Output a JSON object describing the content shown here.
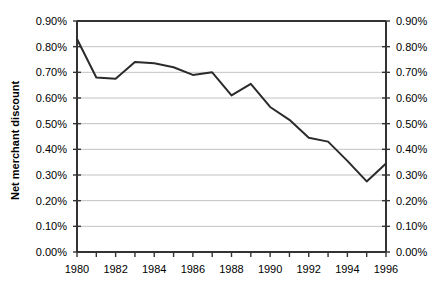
{
  "chart_data": {
    "type": "line",
    "title": "",
    "xlabel": "",
    "ylabel": "Net merchant discount",
    "ylabel_right": "",
    "grid": true,
    "legend": "none",
    "xlim": [
      1980,
      1996
    ],
    "ylim": [
      0.0,
      0.9
    ],
    "y_tick_labels": [
      "0.90%",
      "0.80%",
      "0.70%",
      "0.60%",
      "0.50%",
      "0.40%",
      "0.30%",
      "0.20%",
      "0.10%",
      "0.00%"
    ],
    "y_tick_values": [
      0.9,
      0.8,
      0.7,
      0.6,
      0.5,
      0.4,
      0.3,
      0.2,
      0.1,
      0.0
    ],
    "y_axis_right_tick_labels": [
      "0.90%",
      "0.80%",
      "0.70%",
      "0.60%",
      "0.50%",
      "0.40%",
      "0.30%",
      "0.20%",
      "0.10%",
      "0.00%"
    ],
    "x_tick_labels": [
      "1980",
      "1982",
      "1984",
      "1986",
      "1988",
      "1990",
      "1992",
      "1994",
      "1996"
    ],
    "x_tick_values": [
      1980,
      1982,
      1984,
      1986,
      1988,
      1990,
      1992,
      1994,
      1996
    ],
    "x_minor_tick_values": [
      1981,
      1983,
      1985,
      1987,
      1989,
      1991,
      1993,
      1995
    ],
    "units": "percent",
    "x": [
      1980,
      1981,
      1982,
      1983,
      1984,
      1985,
      1986,
      1987,
      1988,
      1989,
      1990,
      1991,
      1992,
      1993,
      1994,
      1995,
      1996
    ],
    "values": [
      0.83,
      0.68,
      0.675,
      0.74,
      0.735,
      0.72,
      0.69,
      0.7,
      0.61,
      0.655,
      0.565,
      0.515,
      0.445,
      0.43,
      0.355,
      0.275,
      0.345
    ],
    "series": [
      {
        "name": "Net merchant discount",
        "color": "#2b2b2b",
        "values": [
          0.83,
          0.68,
          0.675,
          0.74,
          0.735,
          0.72,
          0.69,
          0.7,
          0.61,
          0.655,
          0.565,
          0.515,
          0.445,
          0.43,
          0.355,
          0.275,
          0.345
        ]
      }
    ]
  },
  "colors": {
    "line": "#2b2b2b",
    "grid": "#b3b3b3",
    "axis": "#333333",
    "text": "#000000",
    "background": "#ffffff"
  }
}
